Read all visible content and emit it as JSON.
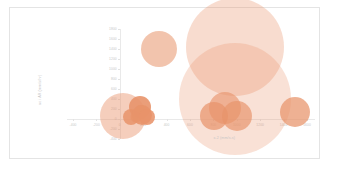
{
  "chart_data": {
    "type": "scatter",
    "title": "",
    "xlabel": "x-2 (mm/s.s)",
    "ylabel": "ac i AR  (mm/s/hr)",
    "xlim": [
      -400,
      1600
    ],
    "ylim": [
      -400,
      1800
    ],
    "grid": false,
    "legend": false,
    "marker_color": "#e8936a",
    "marker_color_light": "#f6d9c4",
    "series": [
      {
        "name": "bubbles",
        "points": [
          {
            "x": 30,
            "y": 60,
            "size": 46,
            "opacity": 0.45
          },
          {
            "x": 95,
            "y": 35,
            "size": 16,
            "opacity": 0.85
          },
          {
            "x": 140,
            "y": 40,
            "size": 11,
            "opacity": 0.8
          },
          {
            "x": 175,
            "y": 250,
            "size": 22,
            "opacity": 0.9
          },
          {
            "x": 180,
            "y": 150,
            "size": 14,
            "opacity": 0.85
          },
          {
            "x": 190,
            "y": 75,
            "size": 20,
            "opacity": 0.9
          },
          {
            "x": 235,
            "y": 45,
            "size": 16,
            "opacity": 0.88
          },
          {
            "x": 335,
            "y": 1400,
            "size": 36,
            "opacity": 0.55
          },
          {
            "x": 805,
            "y": 55,
            "size": 28,
            "opacity": 0.7
          },
          {
            "x": 895,
            "y": 230,
            "size": 32,
            "opacity": 0.62
          },
          {
            "x": 985,
            "y": 1450,
            "size": 98,
            "opacity": 0.32
          },
          {
            "x": 985,
            "y": 400,
            "size": 112,
            "opacity": 0.28
          },
          {
            "x": 1000,
            "y": 55,
            "size": 30,
            "opacity": 0.68
          },
          {
            "x": 1495,
            "y": 145,
            "size": 30,
            "opacity": 0.72
          }
        ]
      }
    ],
    "xticks": [
      {
        "value": -400,
        "label": "-400"
      },
      {
        "value": -200,
        "label": "-200"
      },
      {
        "value": 0,
        "label": "0"
      },
      {
        "value": 200,
        "label": "200"
      },
      {
        "value": 400,
        "label": "400"
      },
      {
        "value": 600,
        "label": "600"
      },
      {
        "value": 800,
        "label": "800"
      },
      {
        "value": 1000,
        "label": "1000"
      },
      {
        "value": 1200,
        "label": "1200"
      },
      {
        "value": 1400,
        "label": "1400"
      },
      {
        "value": 1600,
        "label": "1600"
      },
      {
        "value": 1800,
        "label": "1800"
      }
    ],
    "yticks": [
      {
        "value": 1800,
        "label": "1800"
      },
      {
        "value": 1600,
        "label": "1600"
      },
      {
        "value": 1400,
        "label": "1400"
      },
      {
        "value": 1200,
        "label": "1200"
      },
      {
        "value": 1000,
        "label": "1000"
      },
      {
        "value": 800,
        "label": "800"
      },
      {
        "value": 600,
        "label": "600"
      },
      {
        "value": 400,
        "label": "400"
      },
      {
        "value": 200,
        "label": "200"
      },
      {
        "value": 0,
        "label": "0"
      },
      {
        "value": -200,
        "label": "-200"
      },
      {
        "value": -400,
        "label": "-400"
      }
    ]
  }
}
